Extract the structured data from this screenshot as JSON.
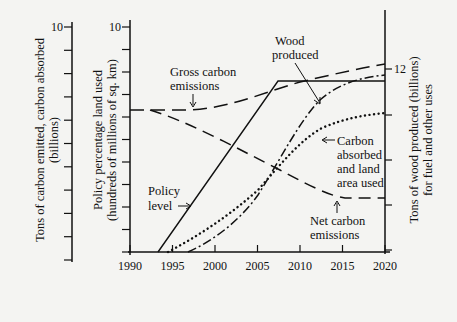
{
  "chart_data": {
    "type": "line",
    "title": "",
    "xlabel": "",
    "x": [
      1990,
      1995,
      2000,
      2005,
      2010,
      2015,
      2020
    ],
    "xlim": [
      1990,
      2020
    ],
    "grid": false,
    "axes": {
      "left_outer": {
        "label_line1": "Tons of carbon emitted, carbon absorbed",
        "label_line2": "(billions)",
        "top_tick_label": "10",
        "tick_count": 11
      },
      "left_inner": {
        "label_line1": "Policy percentage land used",
        "label_line2": "(hundreds of millions of sq. km)",
        "top_tick_label": "10",
        "tick_count": 11
      },
      "right": {
        "label_line1": "Tons of wood produced (billions)",
        "label_line2": "for fuel and other uses",
        "labeled_tick": "12"
      }
    },
    "x_tick_labels": [
      "1990",
      "1995",
      "2000",
      "2005",
      "2010",
      "2015",
      "2020"
    ],
    "series": [
      {
        "name": "Gross carbon emissions",
        "style": "long-dash",
        "x": [
          1990,
          1995,
          2000,
          2005,
          2010,
          2015,
          2020
        ],
        "values": [
          6.3,
          6.3,
          6.6,
          7.3,
          7.8,
          8.1,
          8.3
        ]
      },
      {
        "name": "Net carbon emissions",
        "style": "dash",
        "x": [
          1990,
          1995,
          2000,
          2005,
          2010,
          2015,
          2020
        ],
        "values": [
          6.3,
          6.2,
          5.0,
          3.8,
          2.9,
          2.4,
          2.4
        ]
      },
      {
        "name": "Policy level",
        "style": "solid",
        "x": [
          1990,
          1993.3,
          2007.3,
          2020
        ],
        "values": [
          0,
          0,
          7.5,
          7.5
        ]
      },
      {
        "name": "Wood produced",
        "style": "dash-dot",
        "x": [
          1997,
          2000,
          2005,
          2010,
          2015,
          2020
        ],
        "values": [
          0,
          0.8,
          3.3,
          6.0,
          7.3,
          7.8
        ]
      },
      {
        "name": "Carbon absorbed and land area used",
        "style": "dotted",
        "x": [
          1995,
          2000,
          2005,
          2010,
          2015,
          2020
        ],
        "values": [
          0,
          1.2,
          3.4,
          5.0,
          5.7,
          6.1
        ]
      }
    ],
    "annotations": [
      {
        "text_lines": [
          "Gross carbon",
          "emissions"
        ],
        "points_to": "Gross carbon emissions"
      },
      {
        "text_lines": [
          "Wood",
          "produced"
        ],
        "points_to": "Wood produced"
      },
      {
        "text_lines": [
          "Carbon",
          "absorbed",
          "and land",
          "area used"
        ],
        "points_to": "Carbon absorbed and land area used"
      },
      {
        "text_lines": [
          "Net carbon",
          "emissions"
        ],
        "points_to": "Net carbon emissions"
      },
      {
        "text_lines": [
          "Policy",
          "level"
        ],
        "points_to": "Policy level"
      }
    ]
  }
}
